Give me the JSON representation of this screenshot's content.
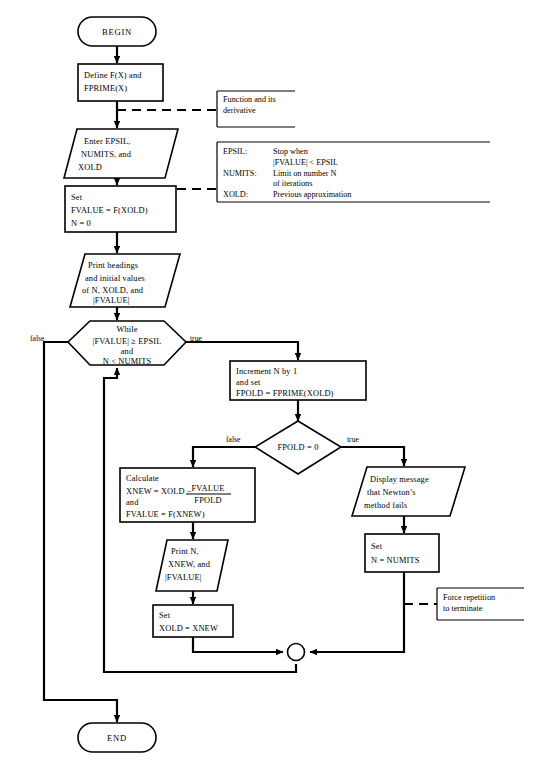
{
  "diagram": {
    "type": "flowchart",
    "background": "#ffffff",
    "ink": "#000000"
  },
  "nodes": {
    "begin": {
      "shape": "terminal",
      "label": "BEGIN"
    },
    "define": {
      "shape": "process",
      "line1": "Define F(X) and",
      "line2": "FPRIME(X)"
    },
    "enter": {
      "shape": "io-parallelogram",
      "line1": "Enter EPSIL,",
      "line2": "NUMITS, and",
      "line3": "XOLD"
    },
    "set_fvalue": {
      "shape": "process",
      "line1": "Set",
      "line2": "FVALUE = F(XOLD)",
      "line3": "N = 0"
    },
    "print_headings": {
      "shape": "io-parallelogram",
      "line1": "Print headings",
      "line2": "and initial values",
      "line3": "of N, XOLD, and",
      "line4": "|FVALUE|"
    },
    "while": {
      "shape": "hexagon-decision",
      "line1": "While",
      "line2": "|FVALUE|  ≥   EPSIL",
      "line3": "and",
      "line4": "N < NUMITS",
      "label_false": "false",
      "label_true": "true"
    },
    "increment": {
      "shape": "process",
      "line1": "Increment N by 1",
      "line2": "and set",
      "line3": "FPOLD = FPRIME(XOLD)"
    },
    "fpold_test": {
      "shape": "diamond-decision",
      "label": "FPOLD  =  0",
      "label_false": "false",
      "label_true": "true"
    },
    "calculate": {
      "shape": "process",
      "line1": "Calculate",
      "line2_prefix": "XNEW  = XOLD  −",
      "frac_numerator": "FVALUE",
      "frac_denominator": "FPOLD",
      "line3": "and",
      "line4": "FVALUE  =  F(XNEW)"
    },
    "print_iter": {
      "shape": "io-parallelogram",
      "line1": "Print N,",
      "line2": "XNEW, and",
      "line3": "|FVALUE|"
    },
    "set_xold": {
      "shape": "process",
      "line1": "Set",
      "line2": "XOLD = XNEW"
    },
    "display_fail": {
      "shape": "io-parallelogram",
      "line1": "Display message",
      "line2": "that Newton’s",
      "line3": "method fails"
    },
    "set_numits": {
      "shape": "process",
      "line1": "Set",
      "line2": "N  =  NUMITS"
    },
    "merge": {
      "shape": "connector-circle",
      "label": ""
    },
    "end": {
      "shape": "terminal",
      "label": "END"
    }
  },
  "annotations": {
    "function_note": {
      "line1": "Function and its",
      "line2": "derivative"
    },
    "params_note": {
      "rows": [
        {
          "term": "EPSIL:",
          "desc1": "Stop when",
          "desc2": "|FVALUE| < EPSIL"
        },
        {
          "term": "NUMITS:",
          "desc1": "Limit on number N",
          "desc2": "of iterations"
        },
        {
          "term": "XOLD:",
          "desc1": "Previous approximation",
          "desc2": ""
        }
      ]
    },
    "force_note": {
      "line1": "Force repetition",
      "line2": "to terminate"
    }
  }
}
